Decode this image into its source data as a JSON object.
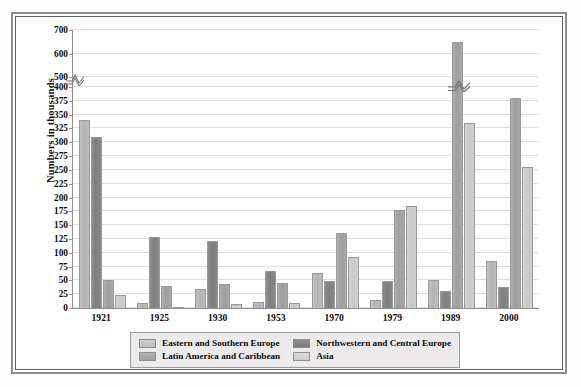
{
  "chart_data": {
    "type": "bar",
    "title": "",
    "xlabel": "",
    "ylabel": "Numbers in thousands",
    "categories": [
      "1921",
      "1925",
      "1930",
      "1953",
      "1970",
      "1979",
      "1989",
      "2000"
    ],
    "series": [
      {
        "name": "Eastern and Southern Europe",
        "color": "#bdbdbd",
        "values": [
          340,
          9,
          35,
          10,
          63,
          14,
          50,
          85
        ]
      },
      {
        "name": "Northwestern and Central Europe",
        "color": "#828282",
        "values": [
          310,
          128,
          122,
          67,
          48,
          48,
          30,
          38
        ]
      },
      {
        "name": "Latin America and Caribbean",
        "color": "#a5a5a5",
        "values": [
          51,
          40,
          43,
          45,
          135,
          177,
          650,
          380
        ]
      },
      {
        "name": "Asia",
        "color": "#cfcfcf",
        "values": [
          24,
          2,
          7,
          9,
          93,
          185,
          335,
          255
        ]
      }
    ],
    "ytick_labels": [
      "0",
      "25",
      "50",
      "75",
      "100",
      "125",
      "150",
      "175",
      "200",
      "225",
      "250",
      "275",
      "300",
      "325",
      "350",
      "375",
      "400",
      "500",
      "600",
      "700"
    ],
    "ytick_values": [
      0,
      25,
      50,
      75,
      100,
      125,
      150,
      175,
      200,
      225,
      250,
      275,
      300,
      325,
      350,
      375,
      400,
      500,
      600,
      700
    ],
    "ylim": [
      0,
      700
    ],
    "axis_break": {
      "present": true,
      "between": [
        400,
        500
      ]
    },
    "grid": true,
    "legend_position": "bottom",
    "legend_entries": [
      "Eastern and Southern Europe",
      "Northwestern and Central Europe",
      "Latin America and Caribbean",
      "Asia"
    ]
  }
}
